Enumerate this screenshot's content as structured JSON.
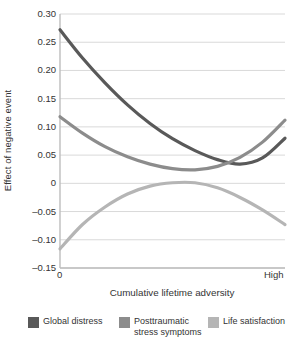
{
  "chart_data": {
    "type": "line",
    "title": "",
    "xlabel": "Cumulative lifetime adversity",
    "ylabel": "Effect of negative event",
    "xlim": [
      0,
      1
    ],
    "ylim": [
      -0.15,
      0.3
    ],
    "grid": true,
    "legend_position": "bottom",
    "xtick_labels": [
      "0",
      "High"
    ],
    "ytick_labels": [
      "0.30",
      "0.25",
      "0.20",
      "0.15",
      "0.10",
      "0.05",
      "0",
      "–0.05",
      "–0.10",
      "–0.15"
    ],
    "ytick_values": [
      0.3,
      0.25,
      0.2,
      0.15,
      0.1,
      0.05,
      0,
      -0.05,
      -0.1,
      -0.15
    ],
    "x": [
      0,
      0.1,
      0.2,
      0.3,
      0.4,
      0.5,
      0.6,
      0.7,
      0.8,
      0.9,
      1.0
    ],
    "series": [
      {
        "name": "Global distress",
        "color": "#595959",
        "values": [
          0.272,
          0.222,
          0.178,
          0.139,
          0.106,
          0.079,
          0.058,
          0.042,
          0.034,
          0.045,
          0.08
        ]
      },
      {
        "name": "Posttraumatic stress symptoms",
        "color": "#8c8c8c",
        "values": [
          0.118,
          0.089,
          0.065,
          0.047,
          0.034,
          0.026,
          0.024,
          0.03,
          0.046,
          0.073,
          0.112
        ]
      },
      {
        "name": "Life satisfaction",
        "color": "#b5b5b5",
        "values": [
          -0.116,
          -0.073,
          -0.042,
          -0.019,
          -0.005,
          0.001,
          0.001,
          -0.008,
          -0.025,
          -0.047,
          -0.073
        ]
      }
    ]
  },
  "axis": {
    "y_title": "Effect of negative event",
    "x_title": "Cumulative lifetime adversity",
    "x_start_label": "0",
    "x_end_label": "High",
    "y_labels": {
      "t0": "0.30",
      "t1": "0.25",
      "t2": "0.20",
      "t3": "0.15",
      "t4": "0.10",
      "t5": "0.05",
      "t6": "0",
      "t7": "–0.05",
      "t8": "–0.10",
      "t9": "–0.15"
    }
  },
  "legend": {
    "items": [
      {
        "label": "Global distress",
        "color": "#595959"
      },
      {
        "label": "Posttraumatic\nstress symptoms",
        "color": "#8c8c8c"
      },
      {
        "label": "Life satisfaction",
        "color": "#b5b5b5"
      }
    ]
  },
  "colors": {
    "grid": "#d9d9d9",
    "axis": "#bdbdbd",
    "text": "#333333",
    "background": "#ffffff"
  }
}
